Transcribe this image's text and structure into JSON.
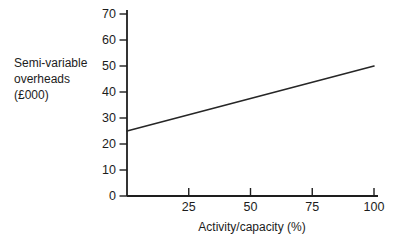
{
  "figure": {
    "ylabel_lines": [
      "Semi-variable",
      "overheads",
      "(£000)"
    ],
    "xlabel": "Activity/capacity (%)"
  },
  "colors": {
    "axis": "#1e1e1e",
    "text": "#1c1c1c",
    "line": "#262626",
    "background": "#ffffff"
  },
  "chart_data": {
    "type": "line",
    "title": "",
    "xlabel": "Activity/capacity (%)",
    "ylabel": "Semi-variable overheads (£000)",
    "xlim": [
      0,
      100
    ],
    "ylim": [
      0,
      70
    ],
    "x_ticks": [
      25,
      50,
      75,
      100
    ],
    "y_ticks": [
      0,
      10,
      20,
      30,
      40,
      50,
      60,
      70
    ],
    "grid": false,
    "legend": false,
    "series": [
      {
        "name": "semi-variable-overheads",
        "x": [
          0,
          100
        ],
        "y": [
          25,
          50
        ]
      }
    ]
  }
}
